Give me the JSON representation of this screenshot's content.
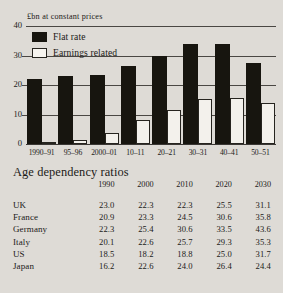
{
  "chart_data": {
    "type": "bar",
    "title": "",
    "ylabel": "£bn at constant prices",
    "xlabel": "",
    "ylim": [
      0,
      40
    ],
    "yticks": [
      0,
      10,
      20,
      30,
      40
    ],
    "grid": true,
    "legend_position": "top-left",
    "categories": [
      "1990–91",
      "95–96",
      "2000–01",
      "10–11",
      "20–21",
      "30–31",
      "40–41",
      "50–51"
    ],
    "series": [
      {
        "name": "Flat rate",
        "color": "#17150f",
        "values": [
          22,
          23,
          23.5,
          26.5,
          30,
          34,
          34,
          27.5
        ]
      },
      {
        "name": "Earnings related",
        "color": "#f3f1ec",
        "values": [
          0.5,
          1.2,
          3.8,
          8.2,
          11.7,
          15.2,
          15.5,
          14
        ]
      }
    ]
  },
  "chart": {
    "axis_title": "£bn at constant prices",
    "legend": [
      {
        "label": "Flat rate",
        "swatch": "flat"
      },
      {
        "label": "Earnings related",
        "swatch": "earn"
      }
    ]
  },
  "table": {
    "title": "Age dependency ratios",
    "corner_header": "",
    "columns": [
      "1990",
      "2000",
      "2010",
      "2020",
      "2030"
    ],
    "rows": [
      {
        "country": "UK",
        "values": [
          "23.0",
          "22.3",
          "22.3",
          "25.5",
          "31.1"
        ]
      },
      {
        "country": "France",
        "values": [
          "20.9",
          "23.3",
          "24.5",
          "30.6",
          "35.8"
        ]
      },
      {
        "country": "Germany",
        "values": [
          "22.3",
          "25.4",
          "30.6",
          "33.5",
          "43.6"
        ]
      },
      {
        "country": "Italy",
        "values": [
          "20.1",
          "22.6",
          "25.7",
          "29.3",
          "35.3"
        ]
      },
      {
        "country": "US",
        "values": [
          "18.5",
          "18.2",
          "18.8",
          "25.0",
          "31.7"
        ]
      },
      {
        "country": "Japan",
        "values": [
          "16.2",
          "22.6",
          "24.0",
          "26.4",
          "24.4"
        ]
      }
    ]
  }
}
